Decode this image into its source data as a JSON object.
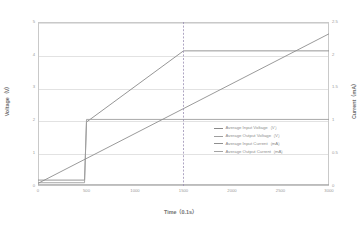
{
  "chart_data": {
    "type": "line",
    "title": "",
    "xlabel": "Time（0.1s）",
    "ylabel": "Voltage（V）",
    "y2label": "Current（mA）",
    "xlim": [
      0,
      3000
    ],
    "ylim": [
      0,
      5
    ],
    "y2lim": [
      0,
      2.5
    ],
    "grid": true,
    "legend_position": "inside-right",
    "xticks": [
      "0",
      "500",
      "1000",
      "1500",
      "2000",
      "2500",
      "3000"
    ],
    "xtick_values": [
      0,
      500,
      1000,
      1500,
      2000,
      2500,
      3000
    ],
    "yticks": [
      "0",
      "1",
      "2",
      "3",
      "4",
      "5"
    ],
    "ytick_values": [
      0,
      1,
      2,
      3,
      4,
      5
    ],
    "y2ticks": [
      "0",
      "0.5",
      "1",
      "1.5",
      "2",
      "2.5"
    ],
    "y2tick_values": [
      0,
      0.5,
      1,
      1.5,
      2,
      2.5
    ],
    "annotations": [
      {
        "type": "vline",
        "x": 1500,
        "style": "dashed",
        "color": "#9b8fb4"
      }
    ],
    "series": [
      {
        "name": "Average Input Voltage（V）",
        "color": "#8a8a8a",
        "axis": "left",
        "x": [
          0,
          480,
          500,
          1500,
          3000
        ],
        "y": [
          0.18,
          0.18,
          1.95,
          4.12,
          4.12
        ]
      },
      {
        "name": "Average Output Voltage（V）",
        "color": "#9e9e9e",
        "axis": "left",
        "x": [
          0,
          480,
          500,
          3000
        ],
        "y": [
          0.1,
          0.1,
          2.03,
          2.03
        ]
      },
      {
        "name": "Average Input Current（mA）",
        "color": "#8f8f8f",
        "axis": "right",
        "x": [
          0,
          3000
        ],
        "y": [
          0.04,
          2.32
        ]
      },
      {
        "name": "Average Output Current（mA）",
        "color": "#a4a4a4",
        "axis": "right",
        "x": [
          0,
          3000
        ],
        "y": [
          0.02,
          0.02
        ]
      }
    ],
    "legend": [
      {
        "label": "Average Input Voltage（V）",
        "color": "#8a8a8a"
      },
      {
        "label": "Average Output Voltage（V）",
        "color": "#9e9e9e"
      },
      {
        "label": "Average Input Current（mA）",
        "color": "#8f8f8f"
      },
      {
        "label": "Average Output Current（mA）",
        "color": "#a4a4a4"
      }
    ]
  }
}
